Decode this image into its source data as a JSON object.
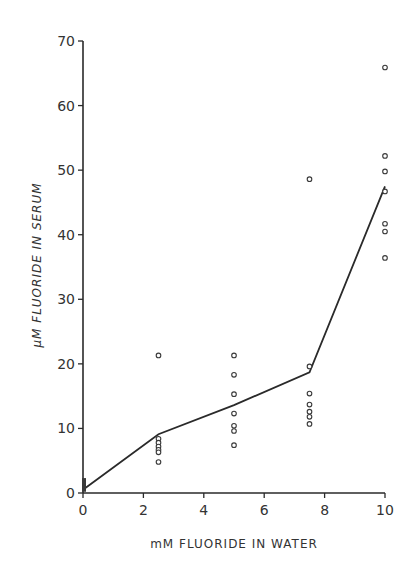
{
  "chart_data": {
    "type": "scatter",
    "title": "",
    "xlabel": "mM FLUORIDE IN WATER",
    "ylabel": "μM FLUORIDE IN SERUM",
    "xlim": [
      0,
      10
    ],
    "ylim": [
      0,
      70
    ],
    "xticks": [
      0,
      2,
      4,
      6,
      8,
      10
    ],
    "yticks": [
      0,
      10,
      20,
      30,
      40,
      50,
      60,
      70
    ],
    "grid": false,
    "legend": null,
    "series": [
      {
        "name": "individual measurements",
        "kind": "scatter",
        "marker": "open-circle",
        "points": [
          {
            "x": 0,
            "y": 0.5
          },
          {
            "x": 0,
            "y": 1.0
          },
          {
            "x": 0,
            "y": 1.5
          },
          {
            "x": 0,
            "y": 2.0
          },
          {
            "x": 2.5,
            "y": 21.3
          },
          {
            "x": 2.5,
            "y": 8.4
          },
          {
            "x": 2.5,
            "y": 7.8
          },
          {
            "x": 2.5,
            "y": 7.2
          },
          {
            "x": 2.5,
            "y": 6.7
          },
          {
            "x": 2.5,
            "y": 6.3
          },
          {
            "x": 2.5,
            "y": 4.8
          },
          {
            "x": 5,
            "y": 21.3
          },
          {
            "x": 5,
            "y": 18.3
          },
          {
            "x": 5,
            "y": 15.3
          },
          {
            "x": 5,
            "y": 12.3
          },
          {
            "x": 5,
            "y": 10.4
          },
          {
            "x": 5,
            "y": 9.6
          },
          {
            "x": 5,
            "y": 7.4
          },
          {
            "x": 7.5,
            "y": 48.6
          },
          {
            "x": 7.5,
            "y": 19.6
          },
          {
            "x": 7.5,
            "y": 15.4
          },
          {
            "x": 7.5,
            "y": 13.7
          },
          {
            "x": 7.5,
            "y": 12.6
          },
          {
            "x": 7.5,
            "y": 11.8
          },
          {
            "x": 7.5,
            "y": 10.7
          },
          {
            "x": 10,
            "y": 65.9
          },
          {
            "x": 10,
            "y": 52.2
          },
          {
            "x": 10,
            "y": 49.8
          },
          {
            "x": 10,
            "y": 46.7
          },
          {
            "x": 10,
            "y": 41.7
          },
          {
            "x": 10,
            "y": 40.5
          },
          {
            "x": 10,
            "y": 36.4
          }
        ]
      },
      {
        "name": "mean",
        "kind": "line",
        "points": [
          {
            "x": 0,
            "y": 0.5
          },
          {
            "x": 2.5,
            "y": 9.1
          },
          {
            "x": 5,
            "y": 13.6
          },
          {
            "x": 7.5,
            "y": 18.7
          },
          {
            "x": 10,
            "y": 47.5
          }
        ]
      }
    ]
  },
  "plot": {
    "origin_px": [
      83,
      493
    ],
    "px_per_x": 30.2,
    "px_per_y": 6.457,
    "line_color": "#2a2a2a",
    "marker_color": "#3a3a3a"
  }
}
